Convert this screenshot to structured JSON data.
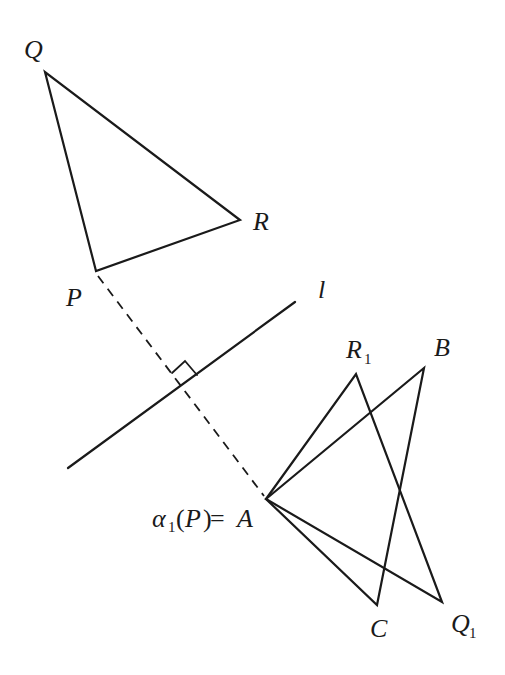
{
  "diagram": {
    "colors": {
      "stroke": "#1a1a1a",
      "background": "#ffffff"
    },
    "points": {
      "Q": {
        "label": "Q",
        "x": 45,
        "y": 72
      },
      "R": {
        "label": "R",
        "x": 240,
        "y": 220
      },
      "P": {
        "label": "P",
        "x": 96,
        "y": 271
      },
      "A": {
        "label": "A",
        "x": 266,
        "y": 499
      },
      "R1": {
        "label": "R",
        "sub": "1",
        "x": 356,
        "y": 374
      },
      "B": {
        "label": "B",
        "x": 424,
        "y": 368
      },
      "C": {
        "label": "C",
        "x": 377,
        "y": 605
      },
      "Q1": {
        "label": "Q",
        "sub": "1",
        "x": 442,
        "y": 602
      }
    },
    "line_l": {
      "label": "l",
      "x1": 68,
      "y1": 468,
      "x2": 295,
      "y2": 302
    },
    "image_label": {
      "alpha": "α",
      "alpha_sub": "1",
      "open": "(",
      "arg": "P",
      "close": ")",
      "eq": " =",
      "rhs": "A"
    },
    "triangles": [
      {
        "name": "PQR",
        "vertices": [
          "P",
          "Q",
          "R"
        ]
      },
      {
        "name": "AR1Q1",
        "vertices": [
          "A",
          "R1",
          "Q1"
        ]
      },
      {
        "name": "ABC",
        "vertices": [
          "A",
          "B",
          "C"
        ]
      }
    ],
    "perpendicular": {
      "from": "P",
      "to": "A",
      "style": "dashed",
      "right_angle_marker": true
    }
  }
}
